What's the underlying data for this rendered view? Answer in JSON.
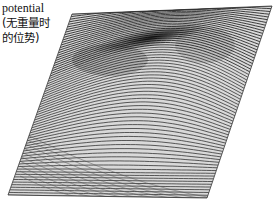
{
  "figure": {
    "label_lines": [
      "potential",
      "(无重量时",
      "的位势)"
    ]
  },
  "chart_data": {
    "type": "surface3d",
    "title": "",
    "zlabel": "potential (无重量时的位势)",
    "xlabel": "",
    "ylabel": "",
    "projection_corners": {
      "top_left": [
        72,
        14
      ],
      "top_right": [
        272,
        6
      ],
      "bottom_right": [
        207,
        198
      ],
      "bottom_left": [
        8,
        195
      ]
    },
    "line_count": 70,
    "line_color": "#2a2a2a",
    "ridge_color": "#111111",
    "background": "#ffffff"
  }
}
